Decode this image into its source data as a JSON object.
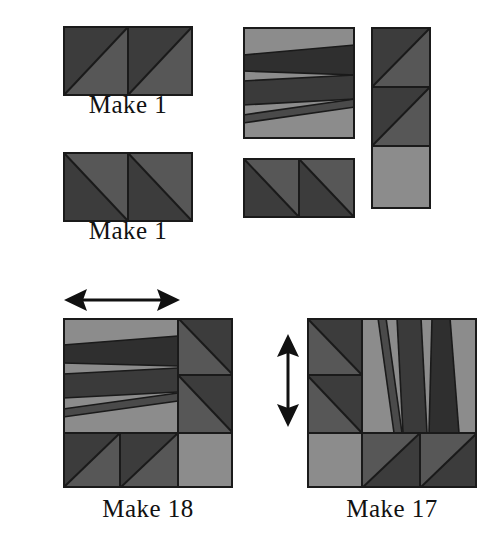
{
  "document": {
    "type": "quilt-block-assembly-diagram",
    "background_color": "#ffffff"
  },
  "palette": {
    "dark": "#3c3c3c",
    "medium": "#575757",
    "light": "#8c8c8c",
    "outline": "#1a1a1a",
    "ink": "#111111",
    "paper": "#ffffff"
  },
  "units": [
    {
      "id": "unit-top-left-1",
      "caption": "Make 1",
      "description": "two half-square triangle squares, diagonal bottom-left to top-right",
      "squares": 2,
      "diagonal": "bottom-left-to-top-right"
    },
    {
      "id": "unit-top-left-2",
      "caption": "Make 1",
      "description": "two half-square triangle squares, diagonal top-left to bottom-right",
      "squares": 2,
      "diagonal": "top-left-to-bottom-right"
    }
  ],
  "components": {
    "string_square": {
      "id": "string-pieced-square",
      "description": "square pieced from angled light and dark strips"
    },
    "hst_pair": {
      "id": "half-square-triangle-pair",
      "description": "two half-square triangle squares side by side"
    },
    "vertical_strip": {
      "id": "vertical-strip-column",
      "description": "two half-square triangle squares above one plain light square"
    }
  },
  "blocks": [
    {
      "id": "block-make-18",
      "caption": "Make 18",
      "arrow": {
        "name": "horizontal-double-arrow",
        "direction": "horizontal",
        "meaning": "block orientation marker"
      }
    },
    {
      "id": "block-make-17",
      "caption": "Make 17",
      "arrow": {
        "name": "vertical-double-arrow",
        "direction": "vertical",
        "meaning": "block orientation marker"
      }
    }
  ],
  "captions": {
    "top_left_first": "Make 1",
    "top_left_second": "Make 1",
    "bottom_left": "Make 18",
    "bottom_right": "Make 17"
  }
}
